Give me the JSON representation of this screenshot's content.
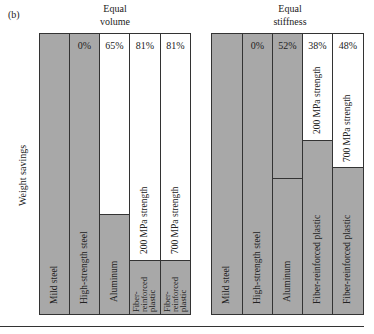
{
  "figure_label": "(b)",
  "y_axis_label": "Weight savings",
  "colors": {
    "gray_fill": "#a8a8a8",
    "white_fill": "#ffffff",
    "border": "#333333"
  },
  "panels": [
    {
      "title_line1": "Equal",
      "title_line2": "volume",
      "columns": [
        {
          "material": "Mild steel",
          "savings": "",
          "gray_top_y": 33
        },
        {
          "material": "High-strength steel",
          "savings": "0%",
          "gray_top_y": 33
        },
        {
          "material": "Aluminum",
          "savings": "65%",
          "gray_top_y": 213
        },
        {
          "material": "Fiber-\nreinforced\nplastic",
          "strength": "200 MPa strength",
          "savings": "81%",
          "gray_top_y": 259
        },
        {
          "material": "Fiber-\nreinforced\nplastic",
          "strength": "700 MPa strength",
          "savings": "81%",
          "gray_top_y": 259
        }
      ]
    },
    {
      "title_line1": "Equal",
      "title_line2": "stiffness",
      "columns": [
        {
          "material": "Mild steel",
          "savings": "",
          "gray_top_y": 33
        },
        {
          "material": "High-strength steel",
          "savings": "0%",
          "gray_top_y": 33
        },
        {
          "material": "Aluminum",
          "savings": "52%",
          "gray_top_y": 33,
          "divider_y": 177
        },
        {
          "material": "Fiber-reinforced plastic",
          "strength": "200 MPa strength",
          "savings": "38%",
          "gray_top_y": 139
        },
        {
          "material": "Fiber-reinforced plastic",
          "strength": "700 MPa strength",
          "savings": "48%",
          "gray_top_y": 166
        }
      ]
    }
  ]
}
